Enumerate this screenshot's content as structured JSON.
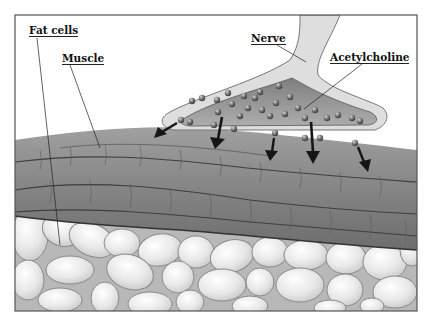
{
  "diagram": {
    "type": "anatomical-illustration",
    "labels": {
      "fat_cells": "Fat cells",
      "muscle": "Muscle",
      "nerve": "Nerve",
      "acetylcholine": "Acetylcholine"
    },
    "colors": {
      "background": "#ffffff",
      "frame": "#555555",
      "muscle": "#8c8c8c",
      "muscle_dark": "#5e5e5e",
      "nerve_outer": "#dcdcdc",
      "nerve_inner": "#9a9a9a",
      "vesicle": "#6e6e6e",
      "fat_cell": "#e6e6e6",
      "fat_bg": "#bdbdbd",
      "arrow": "#1a1a1a",
      "label_text": "#111111"
    }
  }
}
